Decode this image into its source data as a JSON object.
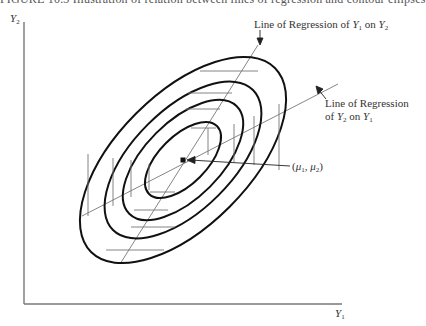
{
  "caption": "FIGURE 10.3   Illustration of relation between lines of regression and contour ellipses",
  "axes": {
    "y_label": "Y",
    "y_label_sub": "2",
    "x_label": "Y",
    "x_label_sub": "1"
  },
  "annotations": {
    "reg_y1_on_y2": {
      "prefix": "Line of Regression of ",
      "var1": "Y",
      "var1_sub": "1",
      "mid": " on ",
      "var2": "Y",
      "var2_sub": "2"
    },
    "reg_y2_on_y1": {
      "line1": "Line of Regression",
      "prefix": "of ",
      "var1": "Y",
      "var1_sub": "2",
      "mid": " on ",
      "var2": "Y",
      "var2_sub": "1"
    },
    "mean_point": {
      "open": "(",
      "m1": "μ",
      "m1_sub": "1",
      "sep": ", ",
      "m2": "μ",
      "m2_sub": "2",
      "close": ")"
    }
  },
  "colors": {
    "ellipse": "#111111",
    "line": "#666666",
    "axis": "#777777"
  }
}
